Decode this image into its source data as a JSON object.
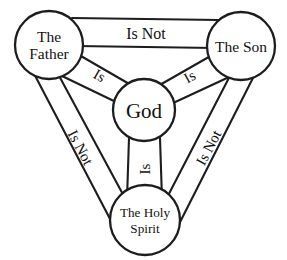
{
  "diagram": {
    "background_color": "#ffffff",
    "stroke_color": "#1d1d1d",
    "text_color": "#111111",
    "nodes": [
      {
        "id": "father",
        "label_line1": "The",
        "label_line2": "Father",
        "position": "top-left"
      },
      {
        "id": "son",
        "label_line1": "The Son",
        "label_line2": "",
        "position": "top-right"
      },
      {
        "id": "god",
        "label_line1": "God",
        "label_line2": "",
        "position": "center"
      },
      {
        "id": "spirit",
        "label_line1": "The Holy",
        "label_line2": "Spirit",
        "position": "bottom-center"
      }
    ],
    "edges": [
      {
        "id": "father-son",
        "label": "Is Not",
        "from": "father",
        "to": "son",
        "orientation": "horizontal-top"
      },
      {
        "id": "father-spirit",
        "label": "Is Not",
        "from": "father",
        "to": "spirit",
        "orientation": "diagonal-left"
      },
      {
        "id": "son-spirit",
        "label": "Is Not",
        "from": "son",
        "to": "spirit",
        "orientation": "diagonal-right"
      },
      {
        "id": "father-god",
        "label": "Is",
        "from": "father",
        "to": "god",
        "orientation": "diagonal-upper-left"
      },
      {
        "id": "son-god",
        "label": "Is",
        "from": "son",
        "to": "god",
        "orientation": "diagonal-upper-right"
      },
      {
        "id": "spirit-god",
        "label": "Is",
        "from": "spirit",
        "to": "god",
        "orientation": "vertical-center"
      }
    ]
  }
}
